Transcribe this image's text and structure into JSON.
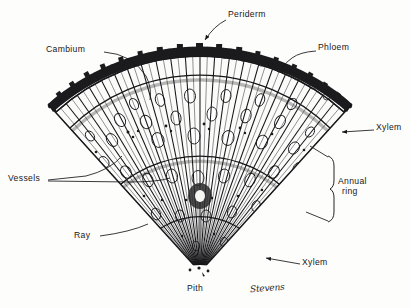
{
  "figure": {
    "kind": "botanical-line-drawing",
    "background_color": "#fdfdfc",
    "ink_color": "#17171a",
    "signature": "Stevens"
  },
  "labels": [
    {
      "key": "periderm",
      "text": "Periderm",
      "x": 228,
      "y": 14,
      "leader": "arrow-down-left"
    },
    {
      "key": "cambium",
      "text": "Cambium",
      "x": 46,
      "y": 49,
      "leader": "curve-right-down"
    },
    {
      "key": "phloem",
      "text": "Phloem",
      "x": 318,
      "y": 47,
      "leader": "curve-left-down"
    },
    {
      "key": "xylem-right",
      "text": "Xylem",
      "x": 376,
      "y": 126,
      "leader": "arrow-left"
    },
    {
      "key": "vessels",
      "text": "Vessels",
      "x": 10,
      "y": 176,
      "leader": "fork-right"
    },
    {
      "key": "annual-ring",
      "line1": "Annual",
      "line2": "ring",
      "x": 332,
      "y": 185,
      "leader": "brace-left"
    },
    {
      "key": "ray",
      "text": "Ray",
      "x": 74,
      "y": 234,
      "leader": "line-up-right"
    },
    {
      "key": "xylem-bottom",
      "text": "Xylem",
      "x": 302,
      "y": 261,
      "leader": "arrow-up-left"
    },
    {
      "key": "pith",
      "text": "Pith",
      "x": 187,
      "y": 287,
      "leader": "none"
    }
  ],
  "anatomy": {
    "layers": [
      "Periderm",
      "Phloem",
      "Cambium",
      "Xylem",
      "Pith"
    ],
    "features": [
      "Vessels",
      "Ray",
      "Annual ring"
    ],
    "annual_rings_visible": 3
  }
}
